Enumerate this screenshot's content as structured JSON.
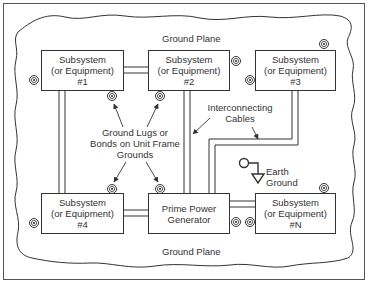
{
  "diagram": {
    "ground_plane_top": "Ground Plane",
    "ground_plane_bottom": "Ground Plane",
    "boxes": [
      {
        "line1": "Subsystem",
        "line2": "(or Equipment)",
        "line3": "#1"
      },
      {
        "line1": "Subsystem",
        "line2": "(or Equipment)",
        "line3": "#2"
      },
      {
        "line1": "Subsystem",
        "line2": "(or Equipment)",
        "line3": "#3"
      },
      {
        "line1": "Subsystem",
        "line2": "(or Equipment)",
        "line3": "#4"
      },
      {
        "line1": "Prime Power",
        "line2": "Generator"
      },
      {
        "line1": "Subsystem",
        "line2": "(or Equipment)",
        "line3": "#N"
      }
    ],
    "ground_lugs_label": [
      "Ground Lugs or",
      "Bonds on Unit Frame",
      "Grounds"
    ],
    "cables_label": [
      "Interconnecting",
      "Cables"
    ],
    "earth_label": [
      "Earth",
      "Ground"
    ],
    "colors": {
      "line": "#333333",
      "background": "#ffffff"
    }
  }
}
